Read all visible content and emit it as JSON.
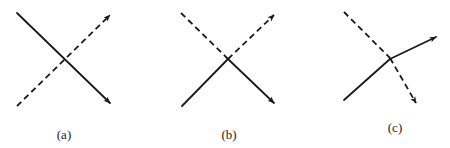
{
  "figure": {
    "panels": [
      {
        "label": "(a)",
        "description": "Two straight lines crossing: solid line top-left to bottom-right, dashed line bottom-left to top-right, both with arrowheads."
      },
      {
        "label": "(b)",
        "description": "Lines swap style at crossing: dashed from top-left becomes solid to bottom-right; solid from bottom-left becomes dashed to top-right."
      },
      {
        "label": "(c)",
        "description": "Lines deflect at crossing: solid from bottom-left bends to upper-right; dashed from top-left bends steeply downward."
      }
    ],
    "colors": {
      "stroke": "#1a1a1a",
      "background": "#ffffff"
    }
  }
}
